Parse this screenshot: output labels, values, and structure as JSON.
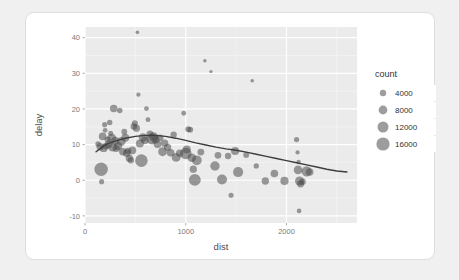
{
  "card": {
    "background": "#ffffff",
    "border_color": "#dedede"
  },
  "chart_data": {
    "type": "scatter",
    "title": "",
    "subtitle": "",
    "xlabel": "dist",
    "ylabel": "delay",
    "xlim": [
      0,
      2700
    ],
    "ylim": [
      -12,
      43
    ],
    "xticks": [
      0,
      1000,
      2000
    ],
    "xtick_labels": [
      "0",
      "1000",
      "2000"
    ],
    "yticks": [
      -10,
      0,
      10,
      20,
      30,
      40
    ],
    "ytick_labels": [
      "-10",
      "0",
      "10",
      "20",
      "30",
      "40"
    ],
    "grid": true,
    "panel_background": "#ebebeb",
    "grid_major_color": "#ffffff",
    "grid_minor_color": "#f5f5f5",
    "point_color": "#4d4d4d",
    "point_opacity": 0.55,
    "size_legend": {
      "title": "count",
      "position": "right",
      "breaks": [
        4000,
        8000,
        12000,
        16000
      ],
      "labels": [
        "4000",
        "8000",
        "12000",
        "16000"
      ],
      "radii_px": [
        3.2,
        4.4,
        5.5,
        6.6
      ]
    },
    "smooth": {
      "type": "loess",
      "color": "#3d3d3d",
      "width": 1.4,
      "points": [
        [
          110,
          8.0
        ],
        [
          200,
          9.9
        ],
        [
          300,
          11.0
        ],
        [
          400,
          11.8
        ],
        [
          500,
          12.3
        ],
        [
          600,
          12.6
        ],
        [
          700,
          12.6
        ],
        [
          800,
          12.3
        ],
        [
          900,
          11.8
        ],
        [
          1000,
          11.2
        ],
        [
          1100,
          10.5
        ],
        [
          1200,
          9.9
        ],
        [
          1300,
          9.3
        ],
        [
          1400,
          8.8
        ],
        [
          1500,
          8.4
        ],
        [
          1600,
          7.9
        ],
        [
          1700,
          7.3
        ],
        [
          1800,
          6.7
        ],
        [
          1900,
          6.1
        ],
        [
          2000,
          5.5
        ],
        [
          2100,
          4.9
        ],
        [
          2200,
          4.3
        ],
        [
          2300,
          3.7
        ],
        [
          2400,
          3.1
        ],
        [
          2500,
          2.6
        ],
        [
          2600,
          2.3
        ]
      ]
    },
    "points": [
      {
        "x": 130,
        "y": 10.2,
        "count": 3000
      },
      {
        "x": 150,
        "y": 9.4,
        "count": 5200
      },
      {
        "x": 160,
        "y": 3.1,
        "count": 16500
      },
      {
        "x": 165,
        "y": -0.4,
        "count": 2600
      },
      {
        "x": 175,
        "y": 12.3,
        "count": 5600
      },
      {
        "x": 185,
        "y": 9.0,
        "count": 6000
      },
      {
        "x": 195,
        "y": 15.6,
        "count": 2600
      },
      {
        "x": 200,
        "y": 14.0,
        "count": 2400
      },
      {
        "x": 210,
        "y": 9.6,
        "count": 4800
      },
      {
        "x": 225,
        "y": 11.4,
        "count": 3800
      },
      {
        "x": 235,
        "y": 10.0,
        "count": 5400
      },
      {
        "x": 245,
        "y": 16.2,
        "count": 3000
      },
      {
        "x": 255,
        "y": 13.2,
        "count": 2600
      },
      {
        "x": 265,
        "y": 11.8,
        "count": 7800
      },
      {
        "x": 275,
        "y": 9.2,
        "count": 6400
      },
      {
        "x": 285,
        "y": 20.1,
        "count": 5400
      },
      {
        "x": 300,
        "y": 11.0,
        "count": 6600
      },
      {
        "x": 310,
        "y": 8.9,
        "count": 5000
      },
      {
        "x": 330,
        "y": 9.6,
        "count": 6200
      },
      {
        "x": 345,
        "y": 19.6,
        "count": 3000
      },
      {
        "x": 360,
        "y": 10.9,
        "count": 7000
      },
      {
        "x": 375,
        "y": 8.0,
        "count": 5200
      },
      {
        "x": 390,
        "y": 13.6,
        "count": 3400
      },
      {
        "x": 400,
        "y": 11.9,
        "count": 6000
      },
      {
        "x": 415,
        "y": 7.6,
        "count": 5600
      },
      {
        "x": 425,
        "y": 8.2,
        "count": 4200
      },
      {
        "x": 440,
        "y": 6.2,
        "count": 5000
      },
      {
        "x": 455,
        "y": 5.6,
        "count": 4000
      },
      {
        "x": 470,
        "y": 8.4,
        "count": 5800
      },
      {
        "x": 485,
        "y": 15.1,
        "count": 4200
      },
      {
        "x": 495,
        "y": 16.0,
        "count": 3600
      },
      {
        "x": 510,
        "y": 14.6,
        "count": 5000
      },
      {
        "x": 520,
        "y": 41.5,
        "count": 1400
      },
      {
        "x": 530,
        "y": 24.0,
        "count": 1900
      },
      {
        "x": 545,
        "y": 10.3,
        "count": 6200
      },
      {
        "x": 560,
        "y": 5.5,
        "count": 14500
      },
      {
        "x": 575,
        "y": 12.0,
        "count": 6800
      },
      {
        "x": 595,
        "y": 11.2,
        "count": 5600
      },
      {
        "x": 610,
        "y": 20.1,
        "count": 2400
      },
      {
        "x": 625,
        "y": 17.0,
        "count": 2400
      },
      {
        "x": 645,
        "y": 13.0,
        "count": 4800
      },
      {
        "x": 665,
        "y": 11.6,
        "count": 11500
      },
      {
        "x": 680,
        "y": 12.2,
        "count": 8000
      },
      {
        "x": 700,
        "y": 11.4,
        "count": 6000
      },
      {
        "x": 720,
        "y": 10.1,
        "count": 5600
      },
      {
        "x": 745,
        "y": 11.9,
        "count": 4600
      },
      {
        "x": 770,
        "y": 8.0,
        "count": 7400
      },
      {
        "x": 790,
        "y": 10.4,
        "count": 5200
      },
      {
        "x": 820,
        "y": 9.2,
        "count": 5000
      },
      {
        "x": 850,
        "y": 7.7,
        "count": 5600
      },
      {
        "x": 880,
        "y": 12.8,
        "count": 4000
      },
      {
        "x": 905,
        "y": 6.4,
        "count": 7400
      },
      {
        "x": 940,
        "y": 7.6,
        "count": 5200
      },
      {
        "x": 980,
        "y": 18.8,
        "count": 2400
      },
      {
        "x": 1000,
        "y": 7.5,
        "count": 12500
      },
      {
        "x": 1010,
        "y": 8.6,
        "count": 6200
      },
      {
        "x": 1025,
        "y": 14.3,
        "count": 3400
      },
      {
        "x": 1045,
        "y": 14.2,
        "count": 3200
      },
      {
        "x": 1060,
        "y": 6.3,
        "count": 7000
      },
      {
        "x": 1075,
        "y": 3.1,
        "count": 5000
      },
      {
        "x": 1090,
        "y": 0.1,
        "count": 13000
      },
      {
        "x": 1110,
        "y": 5.6,
        "count": 9000
      },
      {
        "x": 1150,
        "y": 7.9,
        "count": 4600
      },
      {
        "x": 1190,
        "y": 33.5,
        "count": 1300
      },
      {
        "x": 1250,
        "y": 30.5,
        "count": 1200
      },
      {
        "x": 1290,
        "y": 4.0,
        "count": 8400
      },
      {
        "x": 1320,
        "y": 7.0,
        "count": 4400
      },
      {
        "x": 1360,
        "y": 0.2,
        "count": 9400
      },
      {
        "x": 1420,
        "y": 6.8,
        "count": 4000
      },
      {
        "x": 1450,
        "y": -4.2,
        "count": 2600
      },
      {
        "x": 1490,
        "y": 8.2,
        "count": 6400
      },
      {
        "x": 1520,
        "y": 2.3,
        "count": 9600
      },
      {
        "x": 1600,
        "y": 7.1,
        "count": 3400
      },
      {
        "x": 1660,
        "y": 27.9,
        "count": 1400
      },
      {
        "x": 1700,
        "y": 4.0,
        "count": 2800
      },
      {
        "x": 1790,
        "y": -0.2,
        "count": 5200
      },
      {
        "x": 1880,
        "y": 1.9,
        "count": 5600
      },
      {
        "x": 1980,
        "y": -0.2,
        "count": 6400
      },
      {
        "x": 2100,
        "y": 11.4,
        "count": 2700
      },
      {
        "x": 2110,
        "y": 7.8,
        "count": 1900
      },
      {
        "x": 2120,
        "y": 5.1,
        "count": 2000
      },
      {
        "x": 2115,
        "y": 2.9,
        "count": 7000
      },
      {
        "x": 2130,
        "y": -0.2,
        "count": 7800
      },
      {
        "x": 2140,
        "y": -1.0,
        "count": 5000
      },
      {
        "x": 2125,
        "y": -8.6,
        "count": 2200
      },
      {
        "x": 2160,
        "y": -0.4,
        "count": 4000
      },
      {
        "x": 2200,
        "y": 2.5,
        "count": 9800
      },
      {
        "x": 2230,
        "y": 2.3,
        "count": 5600
      }
    ]
  }
}
